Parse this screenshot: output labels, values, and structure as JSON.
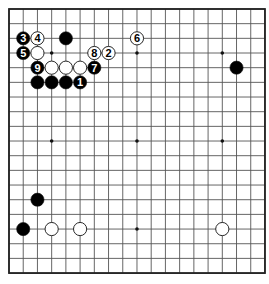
{
  "board": {
    "size": 19,
    "origin_x": 9,
    "origin_y": 9,
    "spacing_x": 14.22,
    "spacing_y": 14.67,
    "line_color": "#555555",
    "border_color": "#222222",
    "background": "#ffffff",
    "stone_radius": 6.6
  },
  "star_points": [
    [
      3,
      3
    ],
    [
      9,
      3
    ],
    [
      15,
      3
    ],
    [
      3,
      9
    ],
    [
      9,
      9
    ],
    [
      15,
      9
    ],
    [
      3,
      15
    ],
    [
      9,
      15
    ],
    [
      15,
      15
    ]
  ],
  "stones": [
    {
      "color": "black",
      "col": 4,
      "row": 2,
      "label": ""
    },
    {
      "color": "black",
      "col": 2,
      "row": 5,
      "label": ""
    },
    {
      "color": "black",
      "col": 3,
      "row": 5,
      "label": ""
    },
    {
      "color": "black",
      "col": 4,
      "row": 5,
      "label": ""
    },
    {
      "color": "black",
      "col": 16,
      "row": 4,
      "label": ""
    },
    {
      "color": "black",
      "col": 2,
      "row": 13,
      "label": ""
    },
    {
      "color": "black",
      "col": 1,
      "row": 15,
      "label": ""
    },
    {
      "color": "black",
      "col": 5,
      "row": 5,
      "label": "1"
    },
    {
      "color": "black",
      "col": 1,
      "row": 2,
      "label": "3"
    },
    {
      "color": "black",
      "col": 1,
      "row": 3,
      "label": "5"
    },
    {
      "color": "black",
      "col": 6,
      "row": 4,
      "label": "7"
    },
    {
      "color": "black",
      "col": 2,
      "row": 4,
      "label": "9"
    },
    {
      "color": "white",
      "col": 2,
      "row": 3,
      "label": ""
    },
    {
      "color": "white",
      "col": 3,
      "row": 4,
      "label": ""
    },
    {
      "color": "white",
      "col": 4,
      "row": 4,
      "label": ""
    },
    {
      "color": "white",
      "col": 5,
      "row": 4,
      "label": ""
    },
    {
      "color": "white",
      "col": 3,
      "row": 15,
      "label": ""
    },
    {
      "color": "white",
      "col": 5,
      "row": 15,
      "label": ""
    },
    {
      "color": "white",
      "col": 15,
      "row": 15,
      "label": ""
    },
    {
      "color": "white",
      "col": 7,
      "row": 3,
      "label": "2"
    },
    {
      "color": "white",
      "col": 2,
      "row": 2,
      "label": "4"
    },
    {
      "color": "white",
      "col": 9,
      "row": 2,
      "label": "6"
    },
    {
      "color": "white",
      "col": 6,
      "row": 3,
      "label": "8"
    }
  ]
}
